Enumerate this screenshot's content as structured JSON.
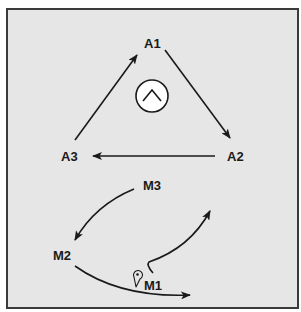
{
  "diagram": {
    "background_color": "#e6e6e6",
    "border_color": "#3a3a3a",
    "stroke_color": "#1a1a1a",
    "top_cycle": {
      "nodes": [
        {
          "id": "A1",
          "label": "A1"
        },
        {
          "id": "A2",
          "label": "A2"
        },
        {
          "id": "A3",
          "label": "A3"
        }
      ],
      "edges": [
        {
          "from": "A1",
          "to": "A2"
        },
        {
          "from": "A2",
          "to": "A3"
        },
        {
          "from": "A3",
          "to": "A1"
        }
      ],
      "center_icon": "up-chevron-in-circle-icon"
    },
    "bottom_cycle": {
      "nodes": [
        {
          "id": "M1",
          "label": "M1"
        },
        {
          "id": "M2",
          "label": "M2"
        },
        {
          "id": "M3",
          "label": "M3"
        }
      ],
      "edges": [
        {
          "from": "M3",
          "to": "M2"
        },
        {
          "from": "M2",
          "to": "M1-region"
        },
        {
          "from": "M1",
          "to": "upper-right-open"
        }
      ],
      "marker_icon": "location-pin-icon"
    }
  }
}
